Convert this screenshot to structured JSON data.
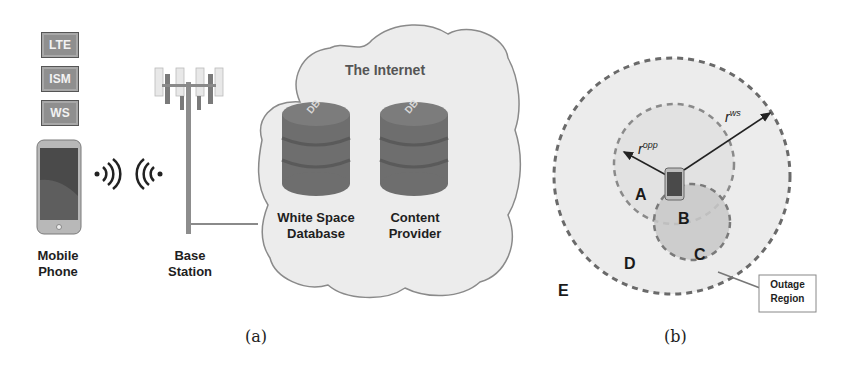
{
  "panel_a": {
    "caption": "(a)",
    "bands": [
      "LTE",
      "ISM",
      "WS"
    ],
    "mobile_label_line1": "Mobile",
    "mobile_label_line2": "Phone",
    "base_label_line1": "Base",
    "base_label_line2": "Station",
    "cloud_title": "The Internet",
    "db1_label_line1": "White Space",
    "db1_label_line2": "Database",
    "db2_label_line1": "Content",
    "db2_label_line2": "Provider",
    "db_icon_text": "DB",
    "icons": [
      "smartphone-icon",
      "wireless-signal-icon",
      "cell-tower-icon",
      "cloud-icon",
      "database-icon"
    ]
  },
  "panel_b": {
    "caption": "(b)",
    "radius_opp": "r",
    "radius_opp_sup": "opp",
    "radius_ws": "r",
    "radius_ws_sup": "ws",
    "regions": [
      "A",
      "B",
      "C",
      "D",
      "E"
    ],
    "callout": "Outage Region",
    "callout_line1": "Outage",
    "callout_line2": "Region"
  },
  "colors": {
    "outer_fill": "#ececec",
    "inner_fill": "#e2e2e2",
    "outage_fill": "#c4c4c4",
    "dash": "#6a6a6a",
    "cloud_fill": "#ededed",
    "db_fill": "#6e6e6e"
  }
}
